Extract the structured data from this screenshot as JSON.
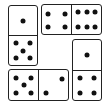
{
  "puzzle": {
    "dominoes": [
      {
        "id": "d1",
        "orientation": "vertical",
        "x": 8,
        "y": 5,
        "w": 30,
        "h": 61,
        "halves": [
          1,
          5
        ]
      },
      {
        "id": "d2",
        "orientation": "horizontal",
        "x": 41,
        "y": 4,
        "w": 61,
        "h": 31,
        "halves": [
          4,
          6
        ]
      },
      {
        "id": "d3",
        "orientation": "horizontal",
        "x": 8,
        "y": 69,
        "w": 61,
        "h": 32,
        "halves": [
          5,
          2
        ]
      },
      {
        "id": "d4",
        "orientation": "vertical",
        "x": 72,
        "y": 39,
        "w": 30,
        "h": 62,
        "halves": [
          1,
          4
        ]
      }
    ],
    "colors": {
      "pip": "#111111",
      "border": "#222222",
      "background": "#ffffff"
    }
  }
}
